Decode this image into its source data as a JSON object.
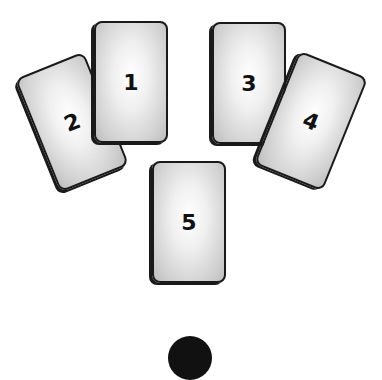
{
  "diagram": {
    "title": "",
    "cards": [
      {
        "position": 1,
        "label": "1"
      },
      {
        "position": 2,
        "label": "2"
      },
      {
        "position": 3,
        "label": "3"
      },
      {
        "position": 4,
        "label": "4"
      },
      {
        "position": 5,
        "label": "5"
      }
    ],
    "colors": {
      "card_border": "#1a1a1a",
      "card_fill_center": "#ffffff",
      "card_fill_edge": "#bdbdbd",
      "marker": "#111111",
      "background": "#ffffff"
    }
  }
}
